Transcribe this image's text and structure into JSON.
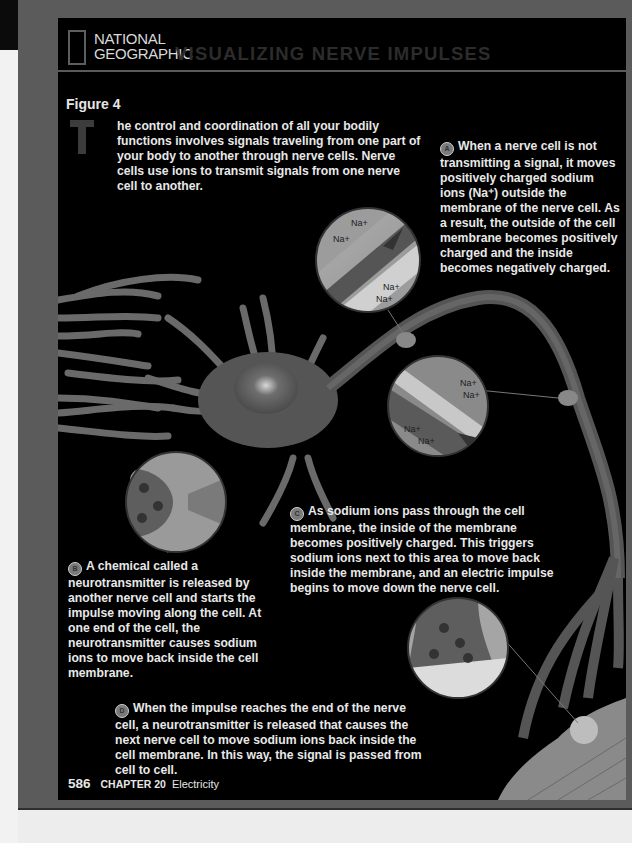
{
  "header": {
    "brand_line1": "NATIONAL",
    "brand_line2": "GEOGRAPHIC",
    "title": "VISUALIZING NERVE IMPULSES"
  },
  "figure_label": "Figure 4",
  "intro": {
    "drop_cap": "T",
    "text": "he control and coordination of all your bodily functions involves signals traveling from one part of your body to another through nerve cells. Nerve cells use ions to transmit signals from one nerve cell to another."
  },
  "callouts": [
    {
      "badge": "A",
      "text": "When a nerve cell is not transmitting a signal, it moves positively charged sodium ions (Na⁺) outside the membrane of the nerve cell. As a result, the outside of the cell membrane becomes positively charged and the inside becomes negatively charged."
    },
    {
      "badge": "B",
      "text": "A chemical called a neurotransmitter is released by another nerve cell and starts the impulse moving along the cell. At one end of the cell, the neurotransmitter causes sodium ions to move back inside the cell membrane."
    },
    {
      "badge": "C",
      "text": "As sodium ions pass through the cell membrane, the inside of the membrane becomes positively charged. This triggers sodium ions next to this area to move back inside the membrane, and an electric impulse begins to move down the nerve cell."
    },
    {
      "badge": "D",
      "text": "When the impulse reaches the end of the nerve cell, a neurotransmitter is released that causes the next nerve cell to move sodium ions back inside the cell membrane. In this way, the signal is passed from cell to cell."
    }
  ],
  "diagram_labels": {
    "ion": "Na+",
    "plus": "+",
    "minus": "−"
  },
  "footer": {
    "page_number": "586",
    "chapter": "CHAPTER 20",
    "subject": "Electricity"
  },
  "colors": {
    "panel": "#000000",
    "frame": "#5b5b5b",
    "text": "#e8e8e8",
    "title": "#2c2c2c"
  }
}
